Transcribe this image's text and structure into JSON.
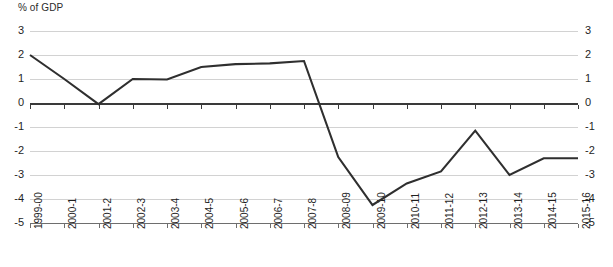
{
  "chart_data": {
    "type": "line",
    "title": "% of GDP",
    "xlabel": "",
    "ylabel": "% of GDP",
    "ylim": [
      -5,
      3
    ],
    "yticks": [
      3,
      2,
      1,
      0,
      -1,
      -2,
      -3,
      -4,
      -5
    ],
    "ytick_labels_left": [
      "3",
      "2",
      "1",
      "0",
      "-1",
      "-2",
      "-3",
      "-4",
      "-5"
    ],
    "ytick_labels_right": [
      "3",
      "2",
      "1",
      "0",
      "-1",
      "-2",
      "-3",
      "-4",
      "-5"
    ],
    "grid": true,
    "legend": "none",
    "dual_axis": true,
    "categories": [
      "1999-00",
      "2000-1",
      "2001-2",
      "2002-3",
      "2003-4",
      "2004-5",
      "2005-6",
      "2006-7",
      "2007-8",
      "2008-09",
      "2009-10",
      "2010-11",
      "2011-12",
      "2012-13",
      "2013-14",
      "2014-15",
      "2015-16"
    ],
    "values": [
      2.0,
      1.0,
      -0.05,
      1.0,
      0.98,
      1.5,
      1.62,
      1.65,
      1.75,
      -2.25,
      -4.25,
      -3.35,
      -2.85,
      -1.15,
      -3.0,
      -2.3,
      -2.3
    ],
    "series": [
      {
        "name": "% of GDP",
        "color": "#2f2f2f",
        "values": [
          2.0,
          1.0,
          -0.05,
          1.0,
          0.98,
          1.5,
          1.62,
          1.65,
          1.75,
          -2.25,
          -4.25,
          -3.35,
          -2.85,
          -1.15,
          -3.0,
          -2.3,
          -2.3
        ]
      }
    ]
  },
  "colors": {
    "line": "#2f2f2f",
    "grid": "#d2d2d2",
    "zero_axis": "#3a3a3a",
    "text": "#1f1f1f",
    "background": "#ffffff"
  }
}
